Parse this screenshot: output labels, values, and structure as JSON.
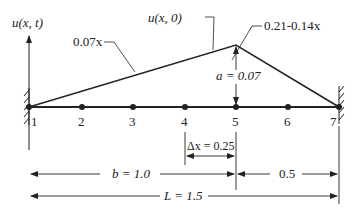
{
  "diagram": {
    "y_axis_label": "u(x, t)",
    "initial_shape_label": "u(x, 0)",
    "left_segment_label": "0.07x",
    "right_segment_label": "0.21-0.14x",
    "amplitude_label": "a = 0.07",
    "nodes": [
      "1",
      "2",
      "3",
      "4",
      "5",
      "6",
      "7"
    ],
    "dx_label": "Δx = 0.25",
    "b_label": "b = 1.0",
    "remainder_label": "0.5",
    "length_label": "L = 1.5",
    "colors": {
      "line": "#222222",
      "background": "#ffffff"
    }
  }
}
